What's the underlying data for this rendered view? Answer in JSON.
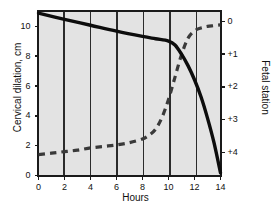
{
  "chart_data": {
    "type": "line",
    "title": "",
    "xlabel": "Hours",
    "ylabel": "Cervical dilation, cm",
    "ylabel_right": "Fetal station",
    "xlim": [
      0,
      14
    ],
    "ylim": [
      0,
      11
    ],
    "ylim_right": [
      -0.3,
      4.7
    ],
    "xticks": [
      "0",
      "2",
      "4",
      "6",
      "8",
      "10",
      "12",
      "14"
    ],
    "xtick_values": [
      0,
      2,
      4,
      6,
      8,
      10,
      12,
      14
    ],
    "yticks": [
      "0",
      "2",
      "4",
      "6",
      "8",
      "10"
    ],
    "ytick_values": [
      0,
      2,
      4,
      6,
      8,
      10
    ],
    "yticks_right": [
      "0",
      "+1",
      "+2",
      "+3",
      "+4"
    ],
    "ytick_right_values": [
      0,
      1,
      2,
      3,
      4
    ],
    "grid": "vertical gridlines at every x tick",
    "legend": "none",
    "plot_background": "#e3e3e3",
    "series": [
      {
        "name": "Cervical dilation",
        "axis": "left",
        "style": "dashed",
        "color": "#3a3a3a",
        "x": [
          0,
          1,
          2,
          3,
          4,
          5,
          6,
          7,
          8,
          8.5,
          9,
          9.5,
          10,
          10.5,
          11,
          11.5,
          12,
          12.5,
          13,
          13.5,
          14
        ],
        "y": [
          1.4,
          1.5,
          1.6,
          1.7,
          1.85,
          1.95,
          2.05,
          2.2,
          2.45,
          2.7,
          3.1,
          3.9,
          5.1,
          6.6,
          8.1,
          9.2,
          9.7,
          9.9,
          10.0,
          10.05,
          10.1
        ]
      },
      {
        "name": "Fetal station",
        "axis": "right",
        "style": "solid",
        "color": "#0d0d0d",
        "x": [
          0,
          2,
          4,
          6,
          8,
          9,
          10,
          10.5,
          11,
          11.5,
          12,
          12.5,
          13,
          13.5,
          14
        ],
        "y": [
          -0.25,
          -0.06,
          0.12,
          0.3,
          0.46,
          0.53,
          0.6,
          0.72,
          1.0,
          1.35,
          1.78,
          2.3,
          2.95,
          3.7,
          4.62
        ]
      }
    ]
  }
}
